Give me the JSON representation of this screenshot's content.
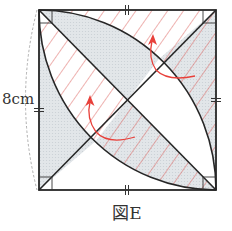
{
  "figure": {
    "caption": "図E",
    "side_length_label": "8cm"
  },
  "colors": {
    "outline": "#262626",
    "gray_fill": "#dfe3e6",
    "hatch": "#d9534f",
    "arrow": "#e8403a",
    "dashed": "#9a9a9a"
  },
  "regions": [
    {
      "name": "top-outer-strip",
      "fill": "white",
      "hatched": true
    },
    {
      "name": "upper-lens-top-part",
      "fill": "gray",
      "hatched": false
    },
    {
      "name": "upper-lens-right-part",
      "fill": "white",
      "hatched": false
    },
    {
      "name": "right-outer-strip",
      "fill": "gray",
      "hatched": true
    },
    {
      "name": "lower-lens-left-part",
      "fill": "white",
      "hatched": true
    },
    {
      "name": "left-outer-strip",
      "fill": "gray",
      "hatched": false
    },
    {
      "name": "lower-lens-bottom-part",
      "fill": "gray",
      "hatched": true
    },
    {
      "name": "bottom-outer-strip",
      "fill": "white",
      "hatched": false
    }
  ],
  "marks": {
    "equal_side_ticks": 4,
    "right_angle_marks": 4,
    "arrows": 2
  }
}
